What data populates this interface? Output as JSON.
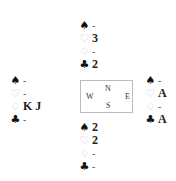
{
  "diagram": {
    "type": "bridge-deal",
    "compass": {
      "north": "N",
      "south": "S",
      "east": "E",
      "west": "W"
    },
    "suit_symbols": {
      "spades": "♠",
      "hearts": "♡",
      "diamonds": "♢",
      "clubs": "♣"
    },
    "colors": {
      "black_suit": "#111111",
      "red_suit_outline": "#c8c8c8",
      "compass_border": "#bdbdbd"
    },
    "hands": {
      "north": {
        "spades": "-",
        "hearts": "3",
        "diamonds": "-",
        "clubs": "2"
      },
      "west": {
        "spades": "-",
        "hearts": "-",
        "diamonds": "K J",
        "clubs": "-"
      },
      "east": {
        "spades": "-",
        "hearts": "A",
        "diamonds": "-",
        "clubs": "A"
      },
      "south": {
        "spades": "2",
        "hearts": "2",
        "diamonds": "-",
        "clubs": "-"
      }
    }
  }
}
